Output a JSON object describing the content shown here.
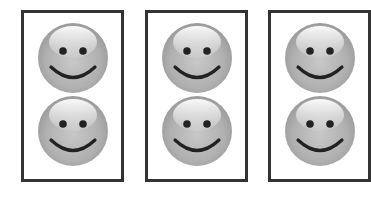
{
  "scene": {
    "background": "#ffffff",
    "border_color": "#333333",
    "face_base_color": "#a9a9a9",
    "face_highlight_color": "#f4f4f4",
    "feature_color": "#222222"
  },
  "cards": [
    {
      "id": "card-1",
      "faces": [
        {
          "icon": "smiley-face-icon"
        },
        {
          "icon": "smiley-face-icon"
        }
      ]
    },
    {
      "id": "card-2",
      "faces": [
        {
          "icon": "smiley-face-icon"
        },
        {
          "icon": "smiley-face-icon"
        }
      ]
    },
    {
      "id": "card-3",
      "faces": [
        {
          "icon": "smiley-face-icon"
        },
        {
          "icon": "smiley-face-icon"
        }
      ]
    }
  ]
}
